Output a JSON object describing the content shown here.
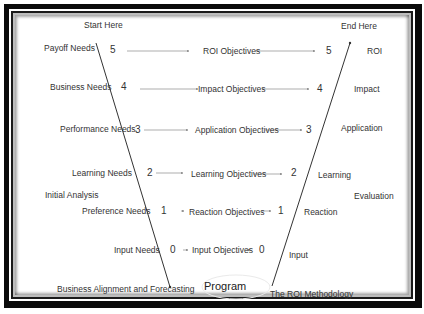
{
  "diagram": {
    "title_left": "Start Here",
    "title_right": "End Here",
    "bottom_left": "Business Alignment and Forecasting",
    "bottom_center": "Program",
    "bottom_right": "The ROI Methodology",
    "side_left": "Initial Analysis",
    "side_right": "Evaluation",
    "levels": [
      {
        "level": "5",
        "need": "Payoff Needs",
        "objective": "ROI Objectives",
        "evaluation": "ROI"
      },
      {
        "level": "4",
        "need": "Business Needs",
        "objective": "Impact Objectives",
        "evaluation": "Impact"
      },
      {
        "level": "3",
        "need": "Performance Needs",
        "objective": "Application Objectives",
        "evaluation": "Application"
      },
      {
        "level": "2",
        "need": "Learning Needs",
        "objective": "Learning Objectives",
        "evaluation": "Learning"
      },
      {
        "level": "1",
        "need": "Preference Needs",
        "objective": "Reaction Objectives",
        "evaluation": "Reaction"
      },
      {
        "level": "0",
        "need": "Input Needs",
        "objective": "Input Objectives",
        "evaluation": "Input"
      }
    ]
  }
}
